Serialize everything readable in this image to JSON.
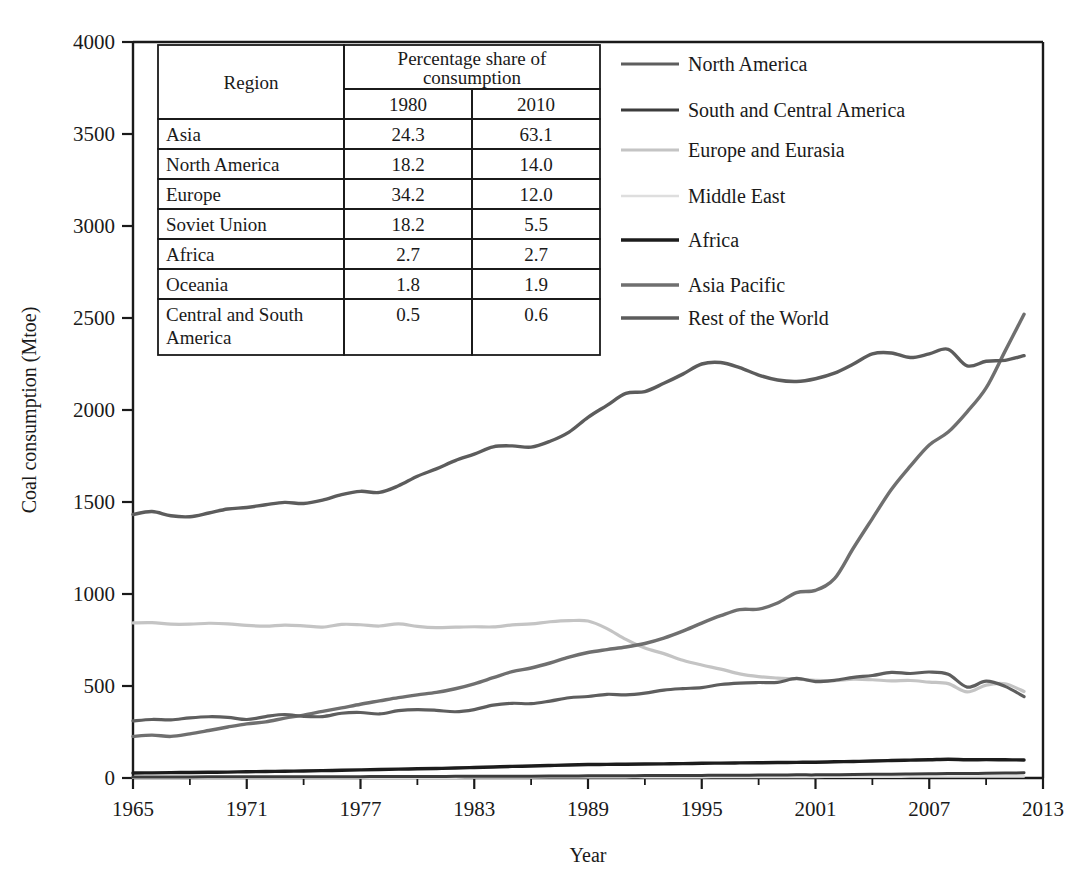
{
  "chart_data": {
    "type": "line",
    "title": "",
    "xlabel": "Year",
    "ylabel": "Coal consumption (Mtoe)",
    "xlim": [
      1965,
      2013
    ],
    "ylim": [
      0,
      4000
    ],
    "xticks": [
      "1965",
      "1971",
      "1977",
      "1983",
      "1989",
      "1995",
      "2001",
      "2007",
      "2013"
    ],
    "yticks": [
      "0",
      "500",
      "1000",
      "1500",
      "2000",
      "2500",
      "3000",
      "3500",
      "4000"
    ],
    "grid": false,
    "legend_position": "top-right",
    "x": [
      1965,
      1966,
      1967,
      1968,
      1969,
      1970,
      1971,
      1972,
      1973,
      1974,
      1975,
      1976,
      1977,
      1978,
      1979,
      1980,
      1981,
      1982,
      1983,
      1984,
      1985,
      1986,
      1987,
      1988,
      1989,
      1990,
      1991,
      1992,
      1993,
      1994,
      1995,
      1996,
      1997,
      1998,
      1999,
      2000,
      2001,
      2002,
      2003,
      2004,
      2005,
      2006,
      2007,
      2008,
      2009,
      2010,
      2011,
      2012
    ],
    "series": [
      {
        "name": "North America",
        "color": "#5e5e5e",
        "width": 3.2,
        "values": [
          310,
          318,
          316,
          327,
          333,
          330,
          318,
          334,
          345,
          335,
          334,
          352,
          356,
          348,
          366,
          372,
          368,
          360,
          372,
          396,
          406,
          404,
          418,
          436,
          443,
          455,
          452,
          461,
          478,
          486,
          491,
          508,
          516,
          519,
          520,
          541,
          524,
          531,
          547,
          557,
          574,
          568,
          576,
          564,
          494,
          526,
          498,
          442
        ]
      },
      {
        "name": "South and Central America",
        "color": "#3c3c3c",
        "width": 3.0,
        "values": [
          6,
          6,
          6,
          6,
          7,
          7,
          7,
          7,
          7,
          7,
          7,
          7,
          7,
          8,
          8,
          8,
          8,
          9,
          9,
          9,
          10,
          10,
          11,
          11,
          12,
          12,
          12,
          13,
          13,
          13,
          14,
          15,
          15,
          16,
          16,
          17,
          17,
          18,
          19,
          20,
          21,
          22,
          23,
          24,
          24,
          26,
          27,
          28
        ]
      },
      {
        "name": "Europe and Eurasia",
        "color": "#c4c4c4",
        "width": 3.2,
        "values": [
          843,
          844,
          836,
          836,
          841,
          838,
          829,
          825,
          831,
          827,
          820,
          835,
          833,
          826,
          838,
          824,
          817,
          820,
          822,
          821,
          832,
          838,
          849,
          855,
          853,
          812,
          753,
          706,
          676,
          640,
          614,
          592,
          566,
          551,
          543,
          538,
          531,
          529,
          537,
          534,
          528,
          530,
          521,
          513,
          468,
          505,
          512,
          470
        ]
      },
      {
        "name": "Middle East",
        "color": "#dedede",
        "width": 2.6,
        "values": [
          1,
          1,
          1,
          1,
          1,
          1,
          1,
          1,
          1,
          1,
          1,
          1,
          2,
          2,
          2,
          2,
          2,
          2,
          3,
          3,
          3,
          3,
          4,
          4,
          4,
          4,
          5,
          5,
          5,
          5,
          5,
          6,
          6,
          6,
          6,
          6,
          6,
          7,
          7,
          7,
          7,
          8,
          8,
          8,
          8,
          9,
          9,
          9
        ]
      },
      {
        "name": "Africa",
        "color": "#1c1c1c",
        "width": 3.4,
        "values": [
          27,
          28,
          29,
          30,
          31,
          32,
          34,
          35,
          37,
          38,
          40,
          42,
          44,
          46,
          48,
          50,
          52,
          54,
          57,
          60,
          63,
          65,
          68,
          71,
          73,
          74,
          75,
          76,
          77,
          78,
          80,
          81,
          82,
          83,
          84,
          85,
          86,
          88,
          90,
          92,
          95,
          97,
          99,
          102,
          99,
          100,
          99,
          98
        ]
      },
      {
        "name": "Asia Pacific",
        "color": "#6f6f6f",
        "width": 3.4,
        "values": [
          226,
          233,
          226,
          240,
          258,
          277,
          294,
          305,
          325,
          342,
          362,
          381,
          401,
          419,
          437,
          452,
          465,
          485,
          512,
          545,
          578,
          598,
          625,
          657,
          682,
          698,
          712,
          731,
          760,
          798,
          842,
          882,
          915,
          918,
          951,
          1008,
          1020,
          1083,
          1250,
          1410,
          1568,
          1695,
          1810,
          1880,
          1990,
          2120,
          2320,
          2520
        ]
      },
      {
        "name": "Rest of the World",
        "color": "#5c5c5c",
        "width": 3.4,
        "values": [
          1432,
          1448,
          1425,
          1420,
          1440,
          1462,
          1470,
          1485,
          1498,
          1492,
          1510,
          1540,
          1558,
          1552,
          1588,
          1640,
          1680,
          1725,
          1760,
          1800,
          1805,
          1798,
          1830,
          1880,
          1960,
          2025,
          2090,
          2100,
          2145,
          2195,
          2250,
          2258,
          2230,
          2190,
          2163,
          2155,
          2170,
          2200,
          2250,
          2305,
          2310,
          2285,
          2305,
          2330,
          2240,
          2265,
          2270,
          2295
        ]
      }
    ],
    "note_series_tail": {
      "rest_of_the_world_end": 2610,
      "asia_pacific_end": 3720
    }
  },
  "legend": {
    "items": [
      {
        "label": "North America"
      },
      {
        "label": "South and Central America"
      },
      {
        "label": "Europe and Eurasia"
      },
      {
        "label": "Middle East"
      },
      {
        "label": "Africa"
      },
      {
        "label": "Asia Pacific"
      },
      {
        "label": "Rest of the World"
      }
    ]
  },
  "inset_table": {
    "col_region": "Region",
    "col_group": "Percentage share of consumption",
    "col_1980": "1980",
    "col_2010": "2010",
    "rows": [
      {
        "region": "Asia",
        "y1980": "24.3",
        "y2010": "63.1"
      },
      {
        "region": "North America",
        "y1980": "18.2",
        "y2010": "14.0"
      },
      {
        "region": "Europe",
        "y1980": "34.2",
        "y2010": "12.0"
      },
      {
        "region": "Soviet Union",
        "y1980": "18.2",
        "y2010": "5.5"
      },
      {
        "region": "Africa",
        "y1980": "2.7",
        "y2010": "2.7"
      },
      {
        "region": "Oceania",
        "y1980": "1.8",
        "y2010": "1.9"
      },
      {
        "region": "Central and South America",
        "y1980": "0.5",
        "y2010": "0.6"
      }
    ]
  },
  "axes": {
    "y_title": "Coal consumption (Mtoe)",
    "x_title": "Year"
  }
}
